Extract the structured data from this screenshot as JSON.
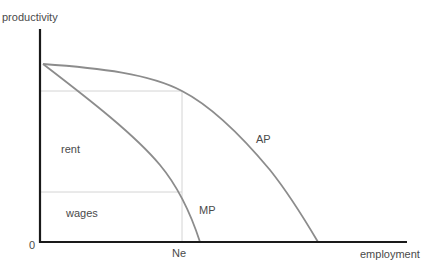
{
  "diagram": {
    "axes": {
      "y_label": "productivity",
      "x_label": "employment",
      "origin_label": "0",
      "x_marker_label": "Ne"
    },
    "curves": [
      {
        "id": "AP",
        "label": "AP",
        "color": "#8c8c8c"
      },
      {
        "id": "MP",
        "label": "MP",
        "color": "#8c8c8c"
      }
    ],
    "regions": {
      "upper": "rent",
      "lower": "wages"
    },
    "colors": {
      "axis": "#1a1a1a",
      "curve": "#8c8c8c",
      "guide": "#d4d4d4",
      "text": "#4a4a4a"
    }
  }
}
